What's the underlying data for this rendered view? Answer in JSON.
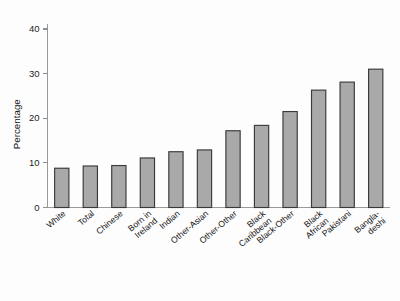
{
  "chart_data": {
    "type": "bar",
    "title": "",
    "xlabel": "",
    "ylabel": "Percentage",
    "ylim": [
      0,
      43
    ],
    "yticks": [
      0,
      10,
      20,
      30,
      40
    ],
    "ytick_labels": [
      "0",
      "10",
      "20",
      "30",
      "40"
    ],
    "grid": false,
    "legend": "none",
    "categories": [
      "White",
      "Total",
      "Chinese",
      "Born in\nIreland",
      "Indian",
      "Other-Asian",
      "Other-Other",
      "Black\nCaribbean",
      "Black-Other",
      "Black\nAfrican",
      "Pakistani",
      "Bangla-\ndeshi"
    ],
    "values": [
      8.8,
      9.3,
      9.4,
      11.1,
      12.5,
      12.9,
      17.2,
      18.4,
      21.5,
      26.3,
      28.1,
      31.0
    ],
    "bar_color": "#a9a9a9",
    "bar_edge_color": "#3a3a3a",
    "axis_color": "#9a9a9a",
    "background_color": "#fdfdfd"
  }
}
